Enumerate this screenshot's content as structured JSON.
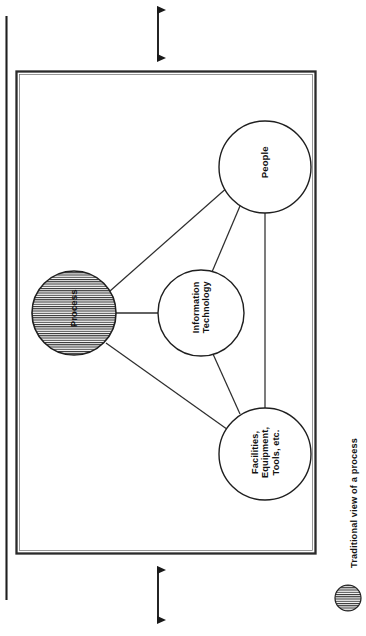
{
  "figure": {
    "caption": "Traditional view of a process",
    "orientation": "rotated-90-ccw",
    "page_rule_present": true
  },
  "diagram": {
    "type": "node-link",
    "frame": {
      "x": 16,
      "y": 71,
      "width": 300,
      "height": 483
    },
    "nodes": [
      {
        "id": "process",
        "label": "Process",
        "lines": [
          "Process"
        ],
        "cx": 74,
        "cy": 313,
        "r": 42,
        "fill": "hatched",
        "hatch": "horizontal-lines",
        "font_size": 9.5
      },
      {
        "id": "people",
        "label": "People",
        "lines": [
          "People"
        ],
        "cx": 265,
        "cy": 167,
        "r": 46,
        "fill": "none",
        "font_size": 9.5
      },
      {
        "id": "information-technology",
        "label": "Information Technology",
        "lines": [
          "Information",
          "Technology"
        ],
        "cx": 201,
        "cy": 313,
        "r": 43,
        "fill": "none",
        "font_size": 9.2
      },
      {
        "id": "facilities-equipment-tools",
        "label": "Facilities, Equipment, Tools, etc.",
        "lines": [
          "Facilities,",
          "Equipment,",
          "Tools, etc."
        ],
        "cx": 265,
        "cy": 454,
        "r": 46,
        "fill": "none",
        "font_size": 9.2
      }
    ],
    "edges": [
      {
        "from": "process",
        "to": "people"
      },
      {
        "from": "process",
        "to": "information-technology"
      },
      {
        "from": "process",
        "to": "facilities-equipment-tools"
      },
      {
        "from": "people",
        "to": "information-technology"
      },
      {
        "from": "people",
        "to": "facilities-equipment-tools"
      },
      {
        "from": "information-technology",
        "to": "facilities-equipment-tools"
      }
    ]
  },
  "annotations": {
    "top_arrow": {
      "name": "double-headed-arrow",
      "orientation": "vertical",
      "x": 158,
      "y1": 2,
      "y2": 66
    },
    "bottom_arrow": {
      "name": "double-headed-arrow",
      "orientation": "vertical",
      "x": 158,
      "y1": 560,
      "y2": 628
    }
  },
  "legend": {
    "marker_label": "hatched-circle",
    "cx": 348,
    "cy": 598,
    "r": 13
  },
  "colors": {
    "ink": "#1a1a1a",
    "line": "#303030",
    "paper": "#ffffff",
    "hatch": "#2b2b2b"
  }
}
